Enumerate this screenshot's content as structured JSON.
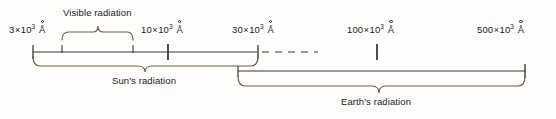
{
  "figure": {
    "background_color": "#fdfdfc",
    "axis_color": "#3a3a38",
    "brace_color": "#7a5c42",
    "text_color": "#1a1a1a"
  },
  "axis": {
    "name": "wavelength-axis",
    "unit": "Å",
    "tick_labels": [
      {
        "id": "t1",
        "mantissa": "3",
        "times": "×",
        "base": "10",
        "exponent": "3",
        "unit": "Å",
        "full": "3 × 10³ Å",
        "x": 33
      },
      {
        "id": "t2",
        "mantissa": "10",
        "times": "×",
        "base": "10",
        "exponent": "3",
        "unit": "Å",
        "full": "10 × 10³ Å",
        "x": 168
      },
      {
        "id": "t3",
        "mantissa": "30",
        "times": "×",
        "base": "10",
        "exponent": "3",
        "unit": "Å",
        "full": "30 × 10³ Å",
        "x": 258
      },
      {
        "id": "t4",
        "mantissa": "100",
        "times": "×",
        "base": "10",
        "exponent": "3",
        "unit": "Å",
        "full": "100 × 10³ Å",
        "x": 377
      },
      {
        "id": "t5",
        "mantissa": "500",
        "times": "×",
        "base": "10",
        "exponent": "3",
        "unit": "Å",
        "full": "500 × 10³ Å",
        "x": 509
      }
    ],
    "minor_ticks": [
      62,
      133
    ],
    "break_style": "dashed"
  },
  "braces": {
    "visible": {
      "label": "Visible radiation",
      "direction": "up",
      "start_x": 62,
      "end_x": 133,
      "name": "visible-radiation-brace"
    },
    "sun": {
      "label": "Sun's radiation",
      "direction": "down",
      "start_x": 33,
      "end_x": 258,
      "name": "suns-radiation-brace"
    },
    "earth": {
      "label": "Earth's radiation",
      "direction": "down",
      "start_x": 238,
      "end_x": 525,
      "name": "earths-radiation-brace"
    }
  }
}
